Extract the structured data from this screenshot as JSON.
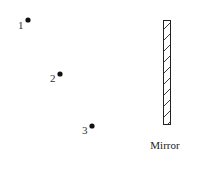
{
  "diagram": {
    "points": [
      {
        "label": "1",
        "x": 28,
        "y": 20
      },
      {
        "label": "2",
        "x": 60,
        "y": 74
      },
      {
        "label": "3",
        "x": 92,
        "y": 126
      }
    ],
    "mirror": {
      "label": "Mirror",
      "x": 163,
      "y": 20,
      "width": 8,
      "height": 105,
      "hatch": "diagonal"
    },
    "colors": {
      "ink": "#222222",
      "background": "#ffffff"
    }
  }
}
